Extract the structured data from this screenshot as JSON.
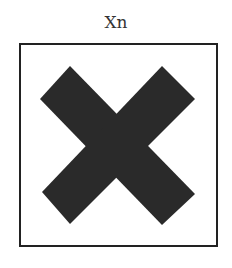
{
  "symbol": {
    "label": "Xn",
    "meaning": "harmful-x-hazard-symbol",
    "colors": {
      "cross": "#2a2a2a",
      "border": "#222222",
      "background": "#ffffff"
    }
  }
}
